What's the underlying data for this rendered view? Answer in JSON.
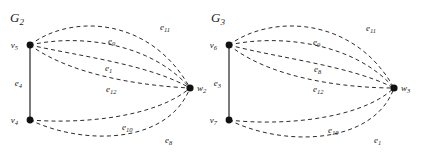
{
  "figure": {
    "width": 427,
    "height": 155,
    "background": "#ffffff",
    "ink_color": "#1a1a1a",
    "dash_color": "#2b2b2b"
  },
  "graphs": [
    {
      "id": "G2",
      "title": "G",
      "title_sub": "2",
      "nodes": [
        {
          "name": "v",
          "sub": "5",
          "x": 30,
          "y": 45,
          "label_dx": -12,
          "label_dy": 3
        },
        {
          "name": "v",
          "sub": "4",
          "x": 30,
          "y": 120,
          "label_dx": -12,
          "label_dy": 3
        },
        {
          "name": "w",
          "sub": "2",
          "x": 190,
          "y": 88,
          "label_dx": 7,
          "label_dy": 3
        }
      ],
      "solid_edges": [
        {
          "name": "e",
          "sub": "4",
          "from": "v5",
          "to": "v4",
          "label_x": 22,
          "label_dy": 0
        }
      ],
      "dashed_edges": [
        {
          "name": "e",
          "sub": "11",
          "from": "v5",
          "to": "w2",
          "label_x": 160,
          "label_y": 30
        },
        {
          "name": "e",
          "sub": "9",
          "from": "v5",
          "to": "w2",
          "label_x": 108,
          "label_y": 44
        },
        {
          "name": "e",
          "sub": "1",
          "from": "v5",
          "to": "w2",
          "label_x": 105,
          "label_y": 71
        },
        {
          "name": "e",
          "sub": "12",
          "from": "v5",
          "to": "w2",
          "label_x": 106,
          "label_y": 92
        },
        {
          "name": "e",
          "sub": "10",
          "from": "v4",
          "to": "w2",
          "label_x": 122,
          "label_y": 130
        },
        {
          "name": "e",
          "sub": "8",
          "from": "v4",
          "to": "w2",
          "label_x": 165,
          "label_y": 143
        }
      ]
    },
    {
      "id": "G3",
      "title": "G",
      "title_sub": "3",
      "nodes": [
        {
          "name": "v",
          "sub": "6",
          "x": 229,
          "y": 45,
          "label_dx": -12,
          "label_dy": 3
        },
        {
          "name": "v",
          "sub": "7",
          "x": 229,
          "y": 120,
          "label_dx": -12,
          "label_dy": 3
        },
        {
          "name": "w",
          "sub": "3",
          "x": 394,
          "y": 88,
          "label_dx": 7,
          "label_dy": 3
        }
      ],
      "solid_edges": [
        {
          "name": "e",
          "sub": "3",
          "from": "v6",
          "to": "v7",
          "label_x": 221,
          "label_dy": 0
        }
      ],
      "dashed_edges": [
        {
          "name": "e",
          "sub": "11",
          "from": "v6",
          "to": "w3",
          "label_x": 366,
          "label_y": 31
        },
        {
          "name": "e",
          "sub": "9",
          "from": "v6",
          "to": "w3",
          "label_x": 313,
          "label_y": 45
        },
        {
          "name": "e",
          "sub": "8",
          "from": "v6",
          "to": "w3",
          "label_x": 314,
          "label_y": 72
        },
        {
          "name": "e",
          "sub": "12",
          "from": "v6",
          "to": "w3",
          "label_x": 313,
          "label_y": 92
        },
        {
          "name": "e",
          "sub": "10",
          "from": "v7",
          "to": "w3",
          "label_x": 328,
          "label_y": 133
        },
        {
          "name": "e",
          "sub": "1",
          "from": "v7",
          "to": "w3",
          "label_x": 374,
          "label_y": 143
        }
      ]
    }
  ]
}
